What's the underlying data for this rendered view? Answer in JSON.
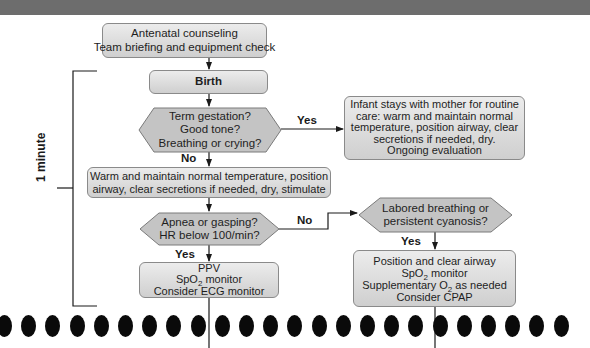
{
  "header_bar": {
    "color": "#6d6d6d"
  },
  "flowchart": {
    "start": {
      "line1": "Antenatal counseling",
      "line2": "Team briefing and equipment check"
    },
    "birth": {
      "label": "Birth"
    },
    "decision1": {
      "line1": "Term gestation?",
      "line2": "Good tone?",
      "line3": "Breathing or crying?"
    },
    "decision1_yes_label": "Yes",
    "decision1_no_label": "No",
    "routine_care": {
      "line1": "Infant stays with mother for routine",
      "line2": "care: warm and maintain normal",
      "line3": "temperature, position airway, clear",
      "line4": "secretions if needed, dry.",
      "line5": "Ongoing evaluation"
    },
    "initial_steps": {
      "line1": "Warm and maintain normal temperature, position",
      "line2": "airway, clear secretions if needed, dry, stimulate"
    },
    "decision2": {
      "line1": "Apnea or gasping?",
      "line2": "HR below 100/min?"
    },
    "decision2_yes_label": "Yes",
    "decision2_no_label": "No",
    "ppv": {
      "line1": "PPV",
      "line2_pre": "SpO",
      "line2_sub": "2",
      "line2_post": " monitor",
      "line3": "Consider ECG monitor"
    },
    "decision3": {
      "line1": "Labored breathing or",
      "line2": "persistent cyanosis?"
    },
    "decision3_yes_label": "Yes",
    "airway_support": {
      "line1": "Position and clear airway",
      "line2_pre": "SpO",
      "line2_sub": "2",
      "line2_post": " monitor",
      "line3_pre": "Supplementary O",
      "line3_sub": "2",
      "line3_post": " as needed",
      "line4": "Consider CPAP"
    },
    "time_bracket_label": "1 minute"
  },
  "colors": {
    "box_fill_top": "#ececec",
    "box_fill_bottom": "#cfcfcf",
    "hex_fill": "#c4c4c4",
    "border": "#8a8a8a",
    "line": "#1a1a1a"
  },
  "binding_dots": {
    "count": 24
  }
}
